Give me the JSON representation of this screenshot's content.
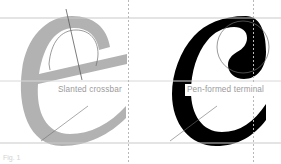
{
  "figure": {
    "background": "#ffffff",
    "caption": "Fig. 1"
  },
  "colors": {
    "glyph_gray": "#b2b2b2",
    "glyph_black": "#000000",
    "guide_line": "#c9c9c9",
    "dotted_guide": "#c9c9c9",
    "overlay_stroke": "#7a7a7a",
    "label_text": "#9a9a9a"
  },
  "guides": {
    "horizontal": [
      {
        "name": "x-height-line",
        "y": 18
      },
      {
        "name": "mid-line",
        "y": 81
      },
      {
        "name": "baseline",
        "y": 143
      }
    ],
    "vertical_dotted": [
      {
        "name": "left-margin-guide",
        "x": 128
      },
      {
        "name": "right-margin-guide",
        "x": 253
      }
    ]
  },
  "glyphs": [
    {
      "name": "glyph-e",
      "character": "e",
      "color": "#b2b2b2",
      "annotation": "Slanted crossbar"
    },
    {
      "name": "glyph-c",
      "character": "c",
      "color": "#000000",
      "annotation": "Pen-formed terminal"
    }
  ],
  "labels": {
    "left": "Slanted crossbar",
    "right": "Pen-formed terminal"
  },
  "overlays": [
    {
      "name": "stress-axis-line",
      "target": "glyph-e"
    },
    {
      "name": "counter-arc-outline",
      "target": "glyph-e"
    },
    {
      "name": "leader-line-left",
      "target": "glyph-e"
    },
    {
      "name": "terminal-circle-outline",
      "target": "glyph-c"
    },
    {
      "name": "leader-line-right",
      "target": "glyph-c"
    }
  ]
}
